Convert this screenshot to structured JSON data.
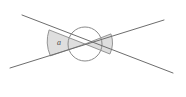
{
  "figure": {
    "background_color": "#ffffff",
    "width": 186,
    "height": 97,
    "line_color": "#6d6d6d",
    "arc_color": "#8a8a8a",
    "wedge_fill_color": "#d9d9d9",
    "label_color": "#4a4a4a",
    "intersection": {
      "x": 85,
      "y": 44
    }
  },
  "labels": {
    "angle_a": "a"
  },
  "lines": [
    {
      "name": "line-1",
      "description": "line descending from upper-left to lower-right",
      "x1": 22,
      "y1": 15,
      "x2": 173,
      "y2": 73
    },
    {
      "name": "line-2",
      "description": "line ascending from lower-left to upper-right",
      "x1": 10,
      "y1": 68,
      "x2": 164,
      "y2": 20
    }
  ],
  "circle": {
    "name": "center-circle",
    "cx": 85,
    "cy": 44,
    "r": 17
  },
  "wedges": [
    {
      "name": "left-angle-wedge",
      "labeled": true,
      "label": "a",
      "radius": 36,
      "label_x": 59,
      "label_y": 43,
      "path": "M 85 44 L 49.1 29.9 A 36 36 0 0 0 50.4 55.9 Z"
    },
    {
      "name": "right-angle-wedge",
      "labeled": false,
      "label": "",
      "radius": 26,
      "path": "M 85 44 L 110.9 33.9 A 26 26 0 0 1 109.9 54.0 Z"
    }
  ]
}
